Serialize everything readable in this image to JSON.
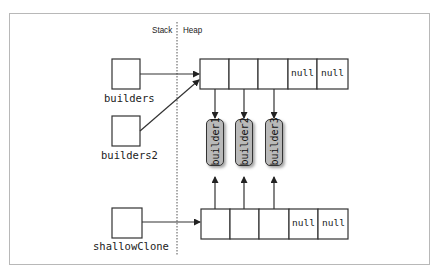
{
  "diagram": {
    "regions": {
      "stack_label": "Stack",
      "heap_label": "Heap"
    },
    "variables": [
      {
        "name": "builders",
        "points_to": "array_top"
      },
      {
        "name": "builders2",
        "points_to": "array_top"
      },
      {
        "name": "shallowClone",
        "points_to": "array_bottom"
      }
    ],
    "arrays": {
      "top": {
        "cells": [
          "",
          "",
          "",
          "null",
          "null"
        ]
      },
      "bottom": {
        "cells": [
          "",
          "",
          "",
          "null",
          "null"
        ]
      }
    },
    "objects": [
      {
        "label": "builder1"
      },
      {
        "label": "builder2"
      },
      {
        "label": "builder3"
      }
    ],
    "colors": {
      "object_fill": "#b9b9b9",
      "line": "#333333",
      "frame": "#b8b8b8"
    }
  }
}
